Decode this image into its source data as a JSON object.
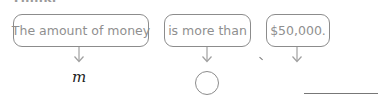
{
  "heading": {
    "partial_text": "Think."
  },
  "phrases": [
    {
      "id": "box-1",
      "text": "The amount of money"
    },
    {
      "id": "box-2",
      "text": "is more than"
    },
    {
      "id": "box-3",
      "text": "$50,000."
    }
  ],
  "translation": {
    "variable": "m",
    "symbol_blank": "",
    "number_blank": ""
  },
  "colors": {
    "box_border": "#8c8c8c",
    "box_text": "#8f8f8f",
    "variable_text": "#222222",
    "arrow": "#a0a0a0"
  }
}
